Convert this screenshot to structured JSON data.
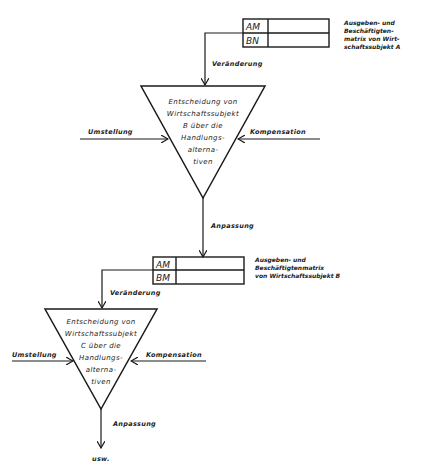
{
  "diagram": {
    "stage_b": {
      "matrix": {
        "row1": "AM",
        "row2": "BN",
        "caption": [
          "Ausgeben- und",
          "Beschäftigten-",
          "matrix von Wirt-",
          "schaftssubjekt A"
        ]
      },
      "input_label": "Veränderung",
      "decision": [
        "Entscheidung von",
        "Wirtschaftssubjekt",
        "B über die",
        "Handlungs-",
        "alterna-",
        "tiven"
      ],
      "left_label": "Umstellung",
      "right_label": "Kompensation",
      "output_label": "Anpassung"
    },
    "stage_c": {
      "matrix": {
        "row1": "AM",
        "row2": "BM",
        "caption": [
          "Ausgeben- und",
          "Beschäftigtenmatrix",
          "von Wirtschaftssubjekt B"
        ]
      },
      "input_label": "Veränderung",
      "decision": [
        "Entscheidung von",
        "Wirtschaftssubjekt",
        "C über die",
        "Handlungs-",
        "alterna-",
        "tiven"
      ],
      "left_label": "Umstellung",
      "right_label": "Kompensation",
      "output_label": "Anpassung"
    },
    "end_label": "usw."
  }
}
